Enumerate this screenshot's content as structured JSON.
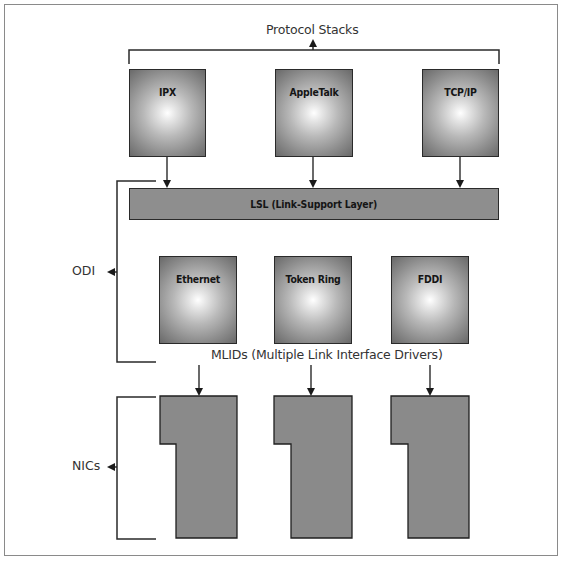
{
  "diagram": {
    "title": "Protocol Stacks",
    "protocol_stacks": [
      {
        "label": "IPX"
      },
      {
        "label": "AppleTalk"
      },
      {
        "label": "TCP/IP"
      }
    ],
    "lsl": {
      "label": "LSL (Link-Support Layer)"
    },
    "mlids": [
      {
        "label": "Ethernet"
      },
      {
        "label": "Token Ring"
      },
      {
        "label": "FDDI"
      }
    ],
    "mlid_caption": "MLIDs (Multiple Link Interface Drivers)",
    "brackets": {
      "odi": "ODI",
      "nics": "NICs"
    },
    "nic_count": 3,
    "colors": {
      "box_edge": "#444444",
      "box_center": "#ffffff",
      "bar_fill": "#8e8e8e",
      "nic_fill": "#8a8a8a",
      "line": "#2a2a2a",
      "text": "#333333"
    }
  }
}
